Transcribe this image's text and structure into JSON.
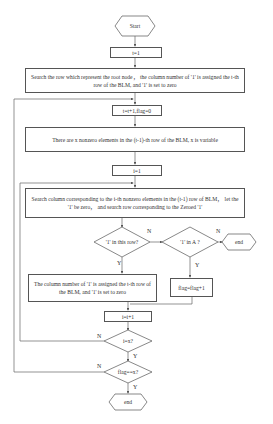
{
  "flowchart": {
    "start": "Start",
    "init_t": "t=1",
    "search_root": "Search the row which represent the root node， the column number of '1'  is assigned  the t-th row of the BLM, and  '1' is set to zero",
    "increment_t": "t=t+1,flag=0",
    "nonzero_count": "There are x nonzero elements in the (t-1)-th row of the BLM, x is variable",
    "init_i": "i=1",
    "search_column": "Search column corresponding to the i-th nonzero elements in the  (t-1)  row of BLM， let the  '1' be zero， and search row corresponding  to the Zeroed  '1'",
    "decision_in_row": "'1' in this row?",
    "decision_in_A": "'1' in A ?",
    "end_right": "end",
    "assign_column": "The column number of '1'  is assigned  the t-th row of the BLM, and  '1' is set to zero",
    "flag_increment": "flag=flag+1",
    "increment_i": "i=i+1",
    "decision_i_eq_x": "i=x?",
    "decision_flag_eq_x": "flag==x?",
    "end_bottom": "end",
    "labels": {
      "n_in_row": "N",
      "y_in_row": "Y",
      "n_in_A": "N",
      "y_in_A": "Y",
      "n_i_eq_x": "N",
      "y_i_eq_x": "Y",
      "n_flag_eq_x": "N",
      "y_flag_eq_x": "Y"
    }
  }
}
